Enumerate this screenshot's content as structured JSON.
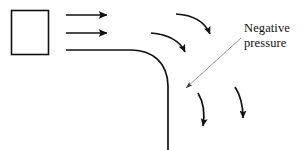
{
  "figure": {
    "background_color": "#ffffff",
    "stroke_color": "#111111",
    "leader_color": "#8a8a8a",
    "width": 303,
    "height": 150
  },
  "annotations": {
    "negative_pressure": {
      "line1": "Negative",
      "line2": "pressure",
      "full_text": "Negative pressure",
      "leader_from_x": 241,
      "leader_from_y": 38,
      "leader_to_x": 181,
      "leader_to_y": 92
    }
  },
  "shapes": {
    "block": {
      "name": "square-block",
      "x": 11,
      "y": 10,
      "width": 38,
      "height": 45
    },
    "wall": {
      "name": "curved-wall",
      "start_x": 66,
      "start_y": 50,
      "corner_x": 168,
      "corner_y": 50,
      "end_x": 168,
      "end_y": 150
    }
  },
  "arrows": {
    "incoming": [
      {
        "name": "incoming-flow-arrow-1",
        "x1": 66,
        "y1": 15,
        "x2": 112,
        "y2": 15
      },
      {
        "name": "incoming-flow-arrow-2",
        "x1": 66,
        "y1": 33,
        "x2": 112,
        "y2": 33
      }
    ],
    "curved": [
      {
        "name": "curved-flow-arrow-upper",
        "x1": 176,
        "y1": 14,
        "cx": 198,
        "cy": 18,
        "x2": 214,
        "y2": 40
      },
      {
        "name": "curved-flow-arrow-lower",
        "x1": 151,
        "y1": 33,
        "cx": 174,
        "cy": 38,
        "x2": 189,
        "y2": 58
      }
    ],
    "downward": [
      {
        "name": "downward-flow-arrow-left",
        "x1": 198,
        "y1": 93,
        "cx": 206,
        "cy": 110,
        "x2": 203,
        "y2": 134
      },
      {
        "name": "downward-flow-arrow-right",
        "x1": 235,
        "y1": 87,
        "cx": 243,
        "cy": 103,
        "x2": 243,
        "y2": 126
      }
    ]
  }
}
